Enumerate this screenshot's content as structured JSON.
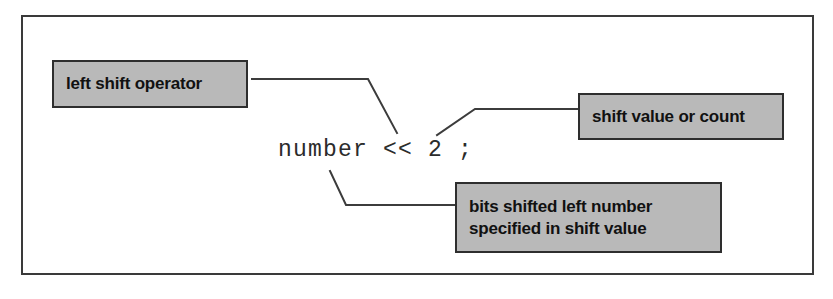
{
  "figure": {
    "background_color": "#ffffff",
    "border_color": "#3a3a3a",
    "callout_fill_color": "#b9b9b9",
    "callout_border_color": "#2e2e2e",
    "text_color": "#111111",
    "code_color": "#2b2b2b",
    "leader_line_color": "#3c3c3c"
  },
  "code": {
    "expression": "number << 2 ;"
  },
  "callouts": {
    "left_shift_operator": {
      "lines": [
        "left shift operator"
      ]
    },
    "shift_value_or_count": {
      "lines": [
        "shift value or count"
      ]
    },
    "bits_shifted": {
      "lines": [
        "bits shifted left number",
        "specified in shift value"
      ]
    }
  },
  "leader_lines": [
    {
      "name": "leader-left-shift-operator",
      "points": "252,79 368,79 397,133"
    },
    {
      "name": "leader-shift-value-or-count",
      "points": "437,135 475,109 578,109"
    },
    {
      "name": "leader-bits-shifted",
      "points": "330,171 346,205 455,205"
    }
  ]
}
